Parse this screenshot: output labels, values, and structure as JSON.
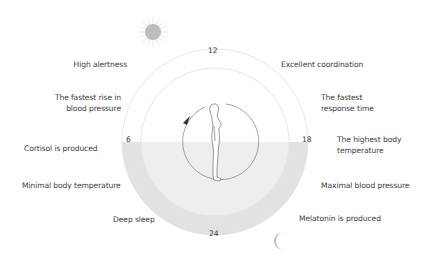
{
  "diagram": {
    "hours": {
      "top": "12",
      "right": "18",
      "bottom": "24",
      "left": "6"
    },
    "left_labels": [
      {
        "text": "High alertness"
      },
      {
        "line1": "The fastest rise in",
        "line2": "blood pressure"
      },
      {
        "text": "Cortisol is produced"
      },
      {
        "text": "Minimal body temperature"
      },
      {
        "text": "Deep sleep"
      }
    ],
    "right_labels": [
      {
        "text": "Excellent coordination"
      },
      {
        "line1": "The fastest",
        "line2": "response time"
      },
      {
        "line1": "The highest body",
        "line2": "temperature"
      },
      {
        "text": "Maximal blood pressure"
      },
      {
        "text": "Melatonin is produced"
      }
    ],
    "icons": {
      "day": "sun-icon",
      "night": "moon-icon",
      "center": "standing-person-icon",
      "direction": "clockwise-arrow-icon"
    },
    "colors": {
      "night_shade": "#e3e3e3",
      "night_inner": "#efefef",
      "ring": "#e6e6e6",
      "line": "#555555",
      "sun": "#b9b9b9",
      "moon": "#bdbdbd"
    }
  }
}
